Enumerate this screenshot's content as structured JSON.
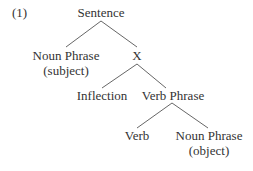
{
  "example_number": "(1)",
  "tree": {
    "root": "Sentence",
    "nodes": {
      "sentence": {
        "label": "Sentence"
      },
      "np_subject": {
        "label": "Noun Phrase",
        "annotation": "(subject)"
      },
      "x": {
        "label": "X"
      },
      "inflection": {
        "label": "Inflection"
      },
      "verb_phrase": {
        "label": "Verb Phrase"
      },
      "verb": {
        "label": "Verb"
      },
      "np_object": {
        "label": "Noun Phrase",
        "annotation": "(object)"
      }
    },
    "edges": [
      [
        "Sentence",
        "Noun Phrase (subject)"
      ],
      [
        "Sentence",
        "X"
      ],
      [
        "X",
        "Inflection"
      ],
      [
        "X",
        "Verb Phrase"
      ],
      [
        "Verb Phrase",
        "Verb"
      ],
      [
        "Verb Phrase",
        "Noun Phrase (object)"
      ]
    ]
  },
  "colors": {
    "text": "#333333",
    "lines": "#555555",
    "background": "#ffffff"
  }
}
